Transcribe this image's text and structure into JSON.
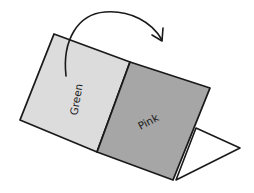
{
  "diagram": {
    "colors": {
      "green_panel": "#dcdcdc",
      "pink_panel": "#a6a6a6",
      "outline": "#1a1a1a",
      "background": "#ffffff"
    },
    "panels": [
      {
        "id": "green",
        "label": "Green",
        "points": "54,34 130,62 97,152 20,120",
        "label_x": 80,
        "label_y": 100,
        "label_rotate": -80
      },
      {
        "id": "pink",
        "label": "Pink",
        "points": "130,62 210,88 173,180 97,152",
        "label_x": 150,
        "label_y": 125,
        "label_rotate": -28
      }
    ],
    "back_flap": {
      "points": "196,128 240,148 176,180"
    },
    "fold_arrow": {
      "path": "M 66 76 C 62 40, 78 14, 105 12 C 130 10, 152 22, 162 40",
      "head": "M 152 35 L 162 41 L 163 28"
    }
  }
}
